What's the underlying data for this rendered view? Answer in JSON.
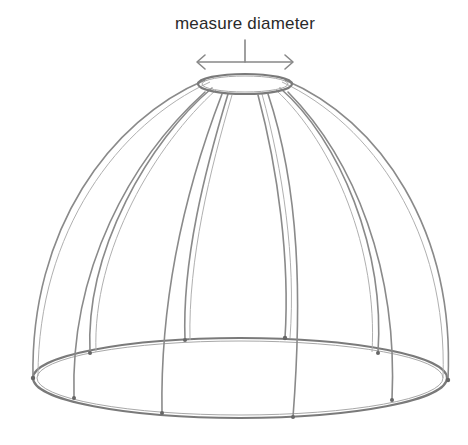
{
  "annotation": {
    "label": "measure diameter",
    "arrow": "double-headed horizontal arrow spanning top ring"
  },
  "illustration": {
    "subject": "dome lampshade wire frame",
    "style": "pencil sketch",
    "stroke_color": "#8a8a8a",
    "background": "#ffffff"
  }
}
